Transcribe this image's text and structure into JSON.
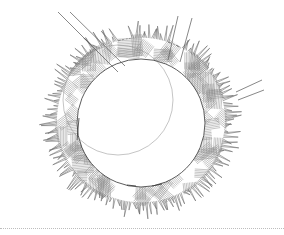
{
  "drawing": {
    "subject": "circular planting island plan",
    "inner_circle": {
      "cx": 141,
      "cy": 123,
      "r": 64
    },
    "outer_ring": {
      "cx": 141,
      "cy": 120,
      "r_inner": 64,
      "r_hatch": 86,
      "r_grass_max": 100
    },
    "secondary_arc": {
      "cx": 118,
      "cy": 100,
      "r": 55,
      "label": ""
    },
    "paths": [
      {
        "name": "path-left-diagonal",
        "points": [
          [
            58,
            12
          ],
          [
            118,
            72
          ]
        ]
      },
      {
        "name": "path-left-diagonal-2",
        "points": [
          [
            70,
            12
          ],
          [
            125,
            66
          ]
        ]
      },
      {
        "name": "path-top-right-posts",
        "points": [
          [
            178,
            16
          ],
          [
            168,
            60
          ]
        ]
      },
      {
        "name": "path-top-right-posts-2",
        "points": [
          [
            192,
            18
          ],
          [
            180,
            62
          ]
        ]
      },
      {
        "name": "path-right-ledge",
        "points": [
          [
            236,
            92
          ],
          [
            262,
            80
          ]
        ]
      },
      {
        "name": "path-right-ledge-2",
        "points": [
          [
            238,
            100
          ],
          [
            264,
            90
          ]
        ]
      }
    ],
    "colors": {
      "line": "#555555",
      "hatch": "#8a8a8a",
      "grass": "#6e6e6e",
      "background": "#ffffff",
      "divider": "#bdbdbd"
    }
  }
}
